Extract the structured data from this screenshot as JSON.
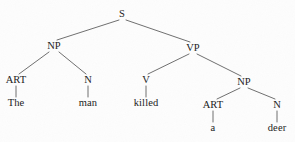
{
  "diagram": {
    "type": "syntax-tree",
    "sentence": "The man killed a deer",
    "background_color": "#fdfdfd",
    "line_color": "#4a4a4a",
    "text_color": "#1a1a1a",
    "nodes": [
      {
        "id": "s",
        "label": "S",
        "kind": "category",
        "x": 122,
        "y": 14
      },
      {
        "id": "np1",
        "label": "NP",
        "kind": "category",
        "x": 54,
        "y": 46
      },
      {
        "id": "vp",
        "label": "VP",
        "kind": "category",
        "x": 193,
        "y": 48
      },
      {
        "id": "art1",
        "label": "ART",
        "kind": "category",
        "x": 16,
        "y": 80
      },
      {
        "id": "n1",
        "label": "N",
        "kind": "category",
        "x": 88,
        "y": 80
      },
      {
        "id": "v",
        "label": "V",
        "kind": "category",
        "x": 146,
        "y": 80
      },
      {
        "id": "np2",
        "label": "NP",
        "kind": "category",
        "x": 244,
        "y": 82
      },
      {
        "id": "the",
        "label": "The",
        "kind": "word",
        "x": 16,
        "y": 103
      },
      {
        "id": "man",
        "label": "man",
        "kind": "word",
        "x": 88,
        "y": 103
      },
      {
        "id": "killed",
        "label": "killed",
        "kind": "word",
        "x": 146,
        "y": 103
      },
      {
        "id": "art2",
        "label": "ART",
        "kind": "category",
        "x": 213,
        "y": 105
      },
      {
        "id": "n2",
        "label": "N",
        "kind": "category",
        "x": 277,
        "y": 105
      },
      {
        "id": "a",
        "label": "a",
        "kind": "word",
        "x": 213,
        "y": 128
      },
      {
        "id": "deer",
        "label": "deer",
        "kind": "word",
        "x": 277,
        "y": 128
      }
    ],
    "edges": [
      {
        "from": "s",
        "to": "np1",
        "x1": 119,
        "y1": 20,
        "x2": 57,
        "y2": 40
      },
      {
        "from": "s",
        "to": "vp",
        "x1": 126,
        "y1": 20,
        "x2": 190,
        "y2": 42
      },
      {
        "from": "np1",
        "to": "art1",
        "x1": 49,
        "y1": 52,
        "x2": 19,
        "y2": 74
      },
      {
        "from": "np1",
        "to": "n1",
        "x1": 59,
        "y1": 52,
        "x2": 86,
        "y2": 74
      },
      {
        "from": "vp",
        "to": "v",
        "x1": 189,
        "y1": 54,
        "x2": 148,
        "y2": 74
      },
      {
        "from": "vp",
        "to": "np2",
        "x1": 197,
        "y1": 54,
        "x2": 241,
        "y2": 76
      },
      {
        "from": "art1",
        "to": "the",
        "x1": 16,
        "y1": 86,
        "x2": 16,
        "y2": 97
      },
      {
        "from": "n1",
        "to": "man",
        "x1": 88,
        "y1": 86,
        "x2": 88,
        "y2": 97
      },
      {
        "from": "v",
        "to": "killed",
        "x1": 146,
        "y1": 86,
        "x2": 146,
        "y2": 97
      },
      {
        "from": "np2",
        "to": "art2",
        "x1": 240,
        "y1": 88,
        "x2": 217,
        "y2": 99
      },
      {
        "from": "np2",
        "to": "n2",
        "x1": 248,
        "y1": 88,
        "x2": 275,
        "y2": 99
      },
      {
        "from": "art2",
        "to": "a",
        "x1": 213,
        "y1": 111,
        "x2": 213,
        "y2": 122
      },
      {
        "from": "n2",
        "to": "deer",
        "x1": 277,
        "y1": 111,
        "x2": 277,
        "y2": 122
      }
    ]
  }
}
